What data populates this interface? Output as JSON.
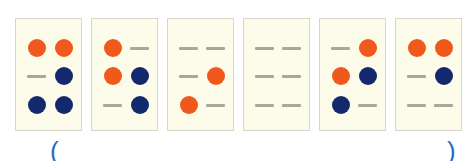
{
  "colors": {
    "orange": "#f0581c",
    "navy": "#13296e",
    "dash": "#a9a69d",
    "card": "#fdfbe9",
    "paren": "#1e6fc4"
  },
  "cards": [
    {
      "cells": [
        [
          "orange",
          "orange"
        ],
        [
          "dash",
          "navy"
        ],
        [
          "navy",
          "navy"
        ]
      ]
    },
    {
      "cells": [
        [
          "orange",
          "dash"
        ],
        [
          "orange",
          "navy"
        ],
        [
          "dash",
          "navy"
        ]
      ]
    },
    {
      "cells": [
        [
          "dash",
          "dash"
        ],
        [
          "dash",
          "orange"
        ],
        [
          "orange",
          "dash"
        ]
      ]
    },
    {
      "cells": [
        [
          "dash",
          "dash"
        ],
        [
          "dash",
          "dash"
        ],
        [
          "dash",
          "dash"
        ]
      ]
    },
    {
      "cells": [
        [
          "dash",
          "orange"
        ],
        [
          "orange",
          "navy"
        ],
        [
          "navy",
          "dash"
        ]
      ]
    },
    {
      "cells": [
        [
          "orange",
          "orange"
        ],
        [
          "dash",
          "navy"
        ],
        [
          "dash",
          "dash"
        ]
      ]
    }
  ],
  "answer": {
    "open": "(",
    "close": ")",
    "value": ""
  }
}
